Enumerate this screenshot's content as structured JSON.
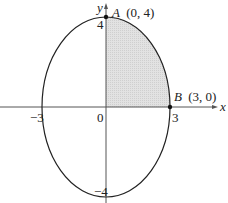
{
  "diagram": {
    "type": "ellipse-quadrant-area",
    "axes": {
      "x_label": "x",
      "y_label": "y",
      "origin_label": "0"
    },
    "ticks": {
      "x_neg": "−3",
      "x_pos": "3",
      "y_pos": "4",
      "y_neg": "−4"
    },
    "points": {
      "A": {
        "name": "A",
        "coords": "(0, 4)"
      },
      "B": {
        "name": "B",
        "coords": "(3, 0)"
      }
    },
    "shaded_region": "first quadrant of ellipse",
    "colors": {
      "curve": "#222222",
      "shade": "#d8d8d8",
      "axis": "#555555"
    }
  }
}
